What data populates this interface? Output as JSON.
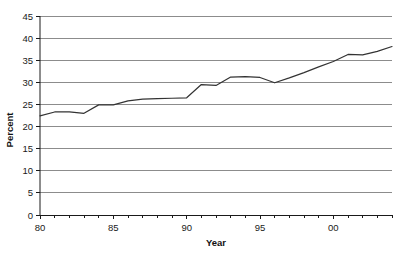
{
  "chart_data": {
    "type": "line",
    "title": "",
    "xlabel": "Year",
    "ylabel": "Percent",
    "xlim": [
      1980,
      2004
    ],
    "ylim": [
      0,
      45
    ],
    "grid": true,
    "grid_axis": "y",
    "legend": false,
    "legend_position": "none",
    "y_ticks": [
      0,
      5,
      10,
      15,
      20,
      25,
      30,
      35,
      40,
      45
    ],
    "y_tick_labels": [
      "0",
      "5",
      "10",
      "15",
      "20",
      "25",
      "30",
      "35",
      "40",
      "45"
    ],
    "x_ticks": [
      1980,
      1985,
      1990,
      1995,
      2000
    ],
    "x_tick_labels": [
      "80",
      "85",
      "90",
      "95",
      "00"
    ],
    "x_minor_ticks": [
      1981,
      1982,
      1983,
      1984,
      1986,
      1987,
      1988,
      1989,
      1991,
      1992,
      1993,
      1994,
      1996,
      1997,
      1998,
      1999,
      2001,
      2002,
      2003,
      2004
    ],
    "x": [
      1980,
      1981,
      1982,
      1983,
      1984,
      1985,
      1986,
      1987,
      1988,
      1989,
      1990,
      1991,
      1992,
      1993,
      1994,
      1995,
      1996,
      1997,
      1998,
      1999,
      2000,
      2001,
      2002,
      2003,
      2004
    ],
    "values": [
      22.4,
      23.3,
      23.3,
      23.0,
      24.9,
      24.9,
      25.8,
      26.2,
      26.3,
      26.4,
      26.5,
      29.5,
      29.3,
      31.2,
      31.3,
      31.1,
      29.9,
      31.0,
      32.2,
      33.5,
      34.7,
      36.3,
      36.2,
      37.0,
      38.1
    ],
    "series": [
      {
        "name": "Percent",
        "color": "#333333",
        "values": [
          22.4,
          23.3,
          23.3,
          23.0,
          24.9,
          24.9,
          25.8,
          26.2,
          26.3,
          26.4,
          26.5,
          29.5,
          29.3,
          31.2,
          31.3,
          31.1,
          29.9,
          31.0,
          32.2,
          33.5,
          34.7,
          36.3,
          36.2,
          37.0,
          38.1
        ]
      }
    ],
    "colors": {
      "line": "#333333",
      "gridline": "#8c8c8c",
      "axis": "#1a1a1a",
      "background": "#ffffff"
    }
  },
  "axes": {
    "y_title": "Percent",
    "x_title": "Year"
  }
}
